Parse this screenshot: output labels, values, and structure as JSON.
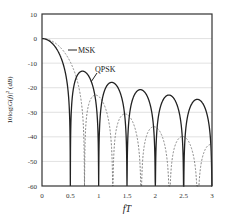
{
  "chart_data": {
    "type": "line",
    "title": "",
    "xlabel": "fT",
    "ylabel": "10log|G(f)|² (dB)",
    "xlim": [
      0,
      3
    ],
    "ylim": [
      -60,
      10
    ],
    "xticks": [
      "0",
      "0.5",
      "1",
      "1.5",
      "2",
      "2.5",
      "3"
    ],
    "yticks": [
      "10",
      "0",
      "-10",
      "-20",
      "-30",
      "-40",
      "-50",
      "-60"
    ],
    "grid": {
      "horizontal": true,
      "vertical": false,
      "color": "#d9d9d9"
    },
    "legend": "inline annotations",
    "annotations": [
      {
        "text": "MSK",
        "x": 0.45,
        "y": -5.2
      },
      {
        "text": "QPSK",
        "x": 0.95,
        "y": -13.0
      }
    ],
    "series": [
      {
        "name": "QPSK",
        "style": "solid",
        "color": "#222222",
        "formula": "10*log10(sinc^2(2 fT))",
        "nulls": [
          0.5,
          1.0,
          1.5,
          2.0,
          2.5,
          3.0
        ],
        "sidelobe_peaks_db": [
          -13.3,
          -17.8,
          -20.8,
          -22.9,
          -24.7
        ]
      },
      {
        "name": "MSK",
        "style": "dashed",
        "color": "#777777",
        "formula": "10*log10([cos(2πfT)/(1-16f²T²)]^2)",
        "nulls": [
          0.75,
          1.25,
          1.75,
          2.25,
          2.75
        ],
        "sidelobe_peaks_db": [
          -23.0,
          -30.8,
          -35.6,
          -39.0,
          -41.6
        ]
      }
    ]
  },
  "labels": {
    "msk": "MSK",
    "qpsk": "QPSK",
    "xlabel": "fT"
  },
  "colors": {
    "qpsk": "#222222",
    "msk": "#777777",
    "grid": "#d9d9d9",
    "frame": "#333333"
  }
}
